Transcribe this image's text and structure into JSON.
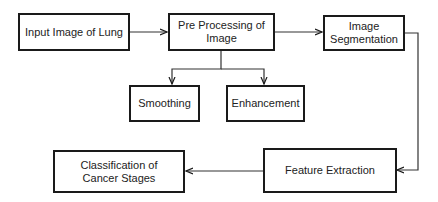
{
  "diagram": {
    "type": "flowchart",
    "nodes": [
      {
        "id": "input",
        "label": "Input Image of Lung"
      },
      {
        "id": "preprocessing",
        "label": "Pre Processing of Image"
      },
      {
        "id": "segmentation",
        "label": "Image Segmentation"
      },
      {
        "id": "smoothing",
        "label": "Smoothing"
      },
      {
        "id": "enhancement",
        "label": "Enhancement"
      },
      {
        "id": "feature",
        "label": "Feature Extraction"
      },
      {
        "id": "classification",
        "label": "Classification of Cancer Stages"
      }
    ],
    "edges": [
      {
        "from": "input",
        "to": "preprocessing"
      },
      {
        "from": "preprocessing",
        "to": "segmentation"
      },
      {
        "from": "preprocessing",
        "to": "smoothing"
      },
      {
        "from": "preprocessing",
        "to": "enhancement"
      },
      {
        "from": "segmentation",
        "to": "feature"
      },
      {
        "from": "feature",
        "to": "classification"
      }
    ]
  },
  "colors": {
    "line": "#1a1a1a",
    "background": "#ffffff"
  }
}
